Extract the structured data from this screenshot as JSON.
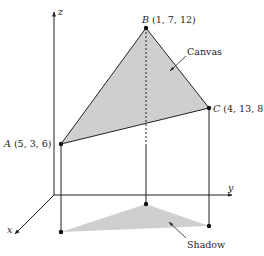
{
  "axes": {
    "x": {
      "label": "x"
    },
    "y": {
      "label": "y"
    },
    "z": {
      "label": "z"
    }
  },
  "points": {
    "A": {
      "name": "A",
      "coords": "(5, 3, 6)",
      "x": 5,
      "y": 3,
      "z": 6
    },
    "B": {
      "name": "B",
      "coords": "(1, 7, 12)",
      "x": 1,
      "y": 7,
      "z": 12
    },
    "C": {
      "name": "C",
      "coords": "(4, 13, 8)",
      "x": 4,
      "y": 13,
      "z": 8
    }
  },
  "annotations": {
    "canvas": "Canvas",
    "shadow": "Shadow"
  },
  "colors": {
    "fill": "#cfcfcf",
    "stroke": "#222222",
    "background": "#ffffff"
  }
}
